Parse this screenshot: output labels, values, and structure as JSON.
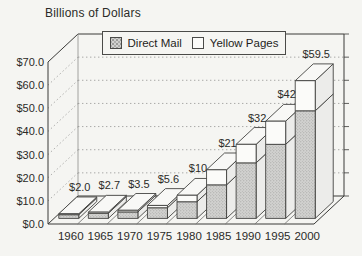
{
  "title": "Billions of Dollars",
  "legend": {
    "items": [
      {
        "label": "Direct Mail",
        "swatch": "stipple-gray"
      },
      {
        "label": "Yellow Pages",
        "swatch": "white"
      }
    ]
  },
  "colors": {
    "background": "#f5f5f2",
    "text": "#2b2b28",
    "edge": "#3a3a38",
    "grid_dots": "#a9a9a7",
    "bar_front_direct_mail": "#d2d2d0",
    "bar_stipple_dot": "#9c9c9a",
    "bar_front_yellow_pages": "#fbfbf9",
    "bar_side": "#ececea",
    "bar_top": "#f8f8f6"
  },
  "chart_data": {
    "type": "bar",
    "stacked": true,
    "projection": "3d",
    "title": "Billions of Dollars",
    "categories": [
      "1960",
      "1965",
      "1970",
      "1975",
      "1980",
      "1985",
      "1990",
      "1995",
      "2000"
    ],
    "series": [
      {
        "name": "Direct Mail",
        "style": "stipple-gray",
        "values": [
          1.6,
          2.2,
          2.8,
          4.6,
          7.2,
          14.5,
          24.0,
          32.0,
          46.5
        ]
      },
      {
        "name": "Yellow Pages",
        "style": "white",
        "values": [
          0.4,
          0.5,
          0.7,
          1.0,
          2.8,
          6.5,
          8.0,
          10.0,
          13.0
        ]
      }
    ],
    "totals": [
      2.0,
      2.7,
      3.5,
      5.6,
      10,
      21,
      32,
      42,
      59.5
    ],
    "total_labels": [
      "$2.0",
      "$2.7",
      "$3.5",
      "$5.6",
      "$10",
      "$21",
      "$32",
      "$42",
      "$59.5"
    ],
    "y_axis": {
      "label": "Billions of Dollars",
      "tick_labels": [
        "$0.0",
        "$10.0",
        "$20.0",
        "$30.0",
        "$40.0",
        "$50.0",
        "$60.0",
        "$70.0"
      ],
      "min": 0,
      "max": 70,
      "step": 10
    },
    "x_axis": {
      "tick_labels": [
        "1960",
        "1965",
        "1970",
        "1975",
        "1980",
        "1985",
        "1990",
        "1995",
        "2000"
      ]
    },
    "legend_position": "top-center",
    "grid": "dotted"
  }
}
